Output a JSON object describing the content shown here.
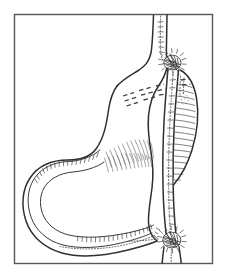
{
  "plate": {
    "caption_strip": "",
    "frame": {
      "x": 14,
      "y": 14,
      "width": 199,
      "height": 250,
      "border_color": "#585858",
      "background_color": "#ffffff"
    },
    "canvas": {
      "width": 231,
      "height": 278,
      "page_background": "#ffffff",
      "ink_color": "#2f2f2f",
      "hatch_color": "#4a4a4a"
    },
    "subject": "stomach-with-duodenum-line-drawing",
    "technique": "pen-and-ink line engraving",
    "structures": [
      {
        "name": "esophagus",
        "label": "",
        "description": "vertical tube entering from top of frame"
      },
      {
        "name": "fundus-and-body",
        "label": "",
        "description": "large curved stomach body occupying left and center"
      },
      {
        "name": "greater-curvature",
        "label": "",
        "description": "long looping lower-left outline"
      },
      {
        "name": "lesser-curvature",
        "label": "",
        "description": "short right-hand margin beside the duodenum"
      },
      {
        "name": "duodenum",
        "label": "",
        "description": "vertical tube descending on the right to bottom of frame"
      },
      {
        "name": "duodenal-lobe",
        "label": "",
        "description": "hatched crescent lobe on right side of duodenum"
      },
      {
        "name": "upper-ligature-knot",
        "label": "",
        "description": "dense stippled knot cluster at upper right"
      },
      {
        "name": "lower-ligature-knot",
        "label": "",
        "description": "dense stippled knot cluster at lower right"
      },
      {
        "name": "rugae-hatching",
        "label": "",
        "description": "short dashed folds across the stomach interior"
      }
    ]
  }
}
